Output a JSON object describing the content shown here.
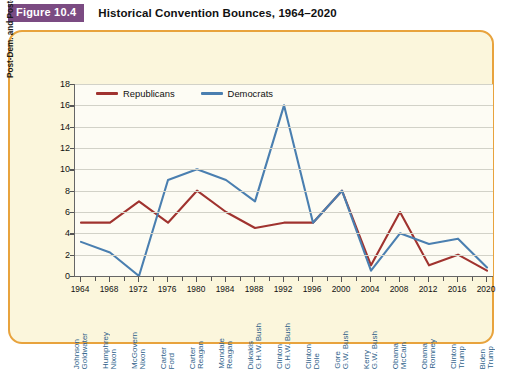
{
  "header": {
    "badge": "Figure 10.4",
    "title": "Historical Convention Bounces, 1964–2020"
  },
  "colors": {
    "republican": "#A0332F",
    "democrat": "#4A7FB0",
    "panel_border": "#E8A33D",
    "panel_bg": "#FBF6DC",
    "plot_bg": "#FDFCF4",
    "badge_bg": "#7B4B82",
    "grid": "#D2D2C8",
    "candidate_label": "#2E5F8A"
  },
  "legend": {
    "position": "top-left-inside",
    "entries": [
      {
        "label": "Republicans",
        "color": "#A0332F"
      },
      {
        "label": "Democrats",
        "color": "#4A7FB0"
      }
    ]
  },
  "chart_data": {
    "type": "line",
    "title": "Historical Convention Bounces, 1964–2020",
    "xlabel": "",
    "ylabel": "Post-Dem. and Post-Rep. convention bounce",
    "ylim": [
      0,
      18
    ],
    "yticks": [
      0,
      2,
      4,
      6,
      8,
      10,
      12,
      14,
      16,
      18
    ],
    "grid": true,
    "categories": [
      1964,
      1968,
      1972,
      1976,
      1980,
      1984,
      1988,
      1992,
      1996,
      2000,
      2004,
      2008,
      2012,
      2016,
      2020
    ],
    "tick_labels": [
      "1964",
      "1968",
      "1972",
      "1976",
      "1980",
      "1984",
      "1988",
      "1992",
      "1996",
      "2000",
      "2004",
      "2008",
      "2012",
      "2016",
      "2020"
    ],
    "candidates": [
      {
        "year": 1964,
        "democrat": "Johnson",
        "republican": "Goldwater"
      },
      {
        "year": 1968,
        "democrat": "Humphrey",
        "republican": "Nixon"
      },
      {
        "year": 1972,
        "democrat": "McGovern",
        "republican": "Nixon"
      },
      {
        "year": 1976,
        "democrat": "Carter",
        "republican": "Ford"
      },
      {
        "year": 1980,
        "democrat": "Carter",
        "republican": "Reagan"
      },
      {
        "year": 1984,
        "democrat": "Mondale",
        "republican": "Reagan"
      },
      {
        "year": 1988,
        "democrat": "Dukakis",
        "republican": "G.H.W. Bush"
      },
      {
        "year": 1992,
        "democrat": "Clinton",
        "republican": "G.H.W. Bush"
      },
      {
        "year": 1996,
        "democrat": "Clinton",
        "republican": "Dole"
      },
      {
        "year": 2000,
        "democrat": "Gore",
        "republican": "G.W. Bush"
      },
      {
        "year": 2004,
        "democrat": "Kerry",
        "republican": "G.W. Bush"
      },
      {
        "year": 2008,
        "democrat": "Obama",
        "republican": "McCain"
      },
      {
        "year": 2012,
        "democrat": "Obama",
        "republican": "Romney"
      },
      {
        "year": 2016,
        "democrat": "Clinton",
        "republican": "Trump"
      },
      {
        "year": 2020,
        "democrat": "Biden",
        "republican": "Trump"
      }
    ],
    "series": [
      {
        "name": "Republicans",
        "color": "#A0332F",
        "values": [
          5.0,
          5.0,
          7.0,
          5.0,
          8.0,
          6.0,
          4.5,
          5.0,
          5.0,
          8.0,
          1.0,
          6.0,
          1.0,
          2.0,
          0.5
        ]
      },
      {
        "name": "Democrats",
        "color": "#4A7FB0",
        "values": [
          3.2,
          2.2,
          0.0,
          9.0,
          10.0,
          9.0,
          7.0,
          16.0,
          5.0,
          8.0,
          0.5,
          4.0,
          3.0,
          3.5,
          0.8
        ]
      }
    ]
  }
}
